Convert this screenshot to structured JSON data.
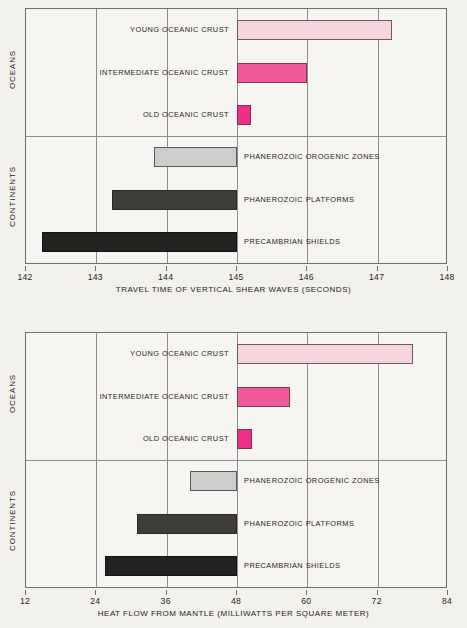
{
  "figure": {
    "title": "",
    "background": "#f3f1ec"
  },
  "colors": {
    "young_oceanic_crust": "#f6d3dd",
    "intermediate_oceanic_crust": "#f2599b",
    "old_oceanic_crust": "#ef2f86",
    "phanerozoic_orogenic_zones": "#cdcdcb",
    "phanerozoic_platforms": "#3e3d3a",
    "precambrian_shields": "#232220",
    "frame": "#6e6e6e",
    "grid": "#8d8d8d"
  },
  "groups": {
    "oceans": "OCEANS",
    "continents": "CONTINENTS"
  },
  "chart_data": [
    {
      "type": "bar",
      "orientation": "horizontal",
      "id": "travel-time",
      "title": "",
      "xlabel": "TRAVEL TIME OF VERTICAL SHEAR WAVES (SECONDS)",
      "ylabel": "",
      "xlim": [
        142,
        148
      ],
      "xticks": [
        142,
        143,
        144,
        145,
        146,
        147,
        148
      ],
      "xticklabels": [
        "142",
        "143",
        "144",
        "145",
        "146",
        "147",
        "148"
      ],
      "grid": true,
      "legend": "none",
      "group_divider_after": 3,
      "categories": [
        "YOUNG OCEANIC CRUST",
        "INTERMEDIATE OCEANIC CRUST",
        "OLD OCEANIC CRUST",
        "PHANEROZOIC OROGENIC ZONES",
        "PHANEROZOIC PLATFORMS",
        "PRECAMBRIAN SHIELDS"
      ],
      "bars": [
        {
          "label": "YOUNG OCEANIC CRUST",
          "start": 145.0,
          "end": 147.2,
          "style": "young",
          "group": "oceans",
          "label_side": "left"
        },
        {
          "label": "INTERMEDIATE OCEANIC CRUST",
          "start": 145.0,
          "end": 146.0,
          "style": "intermediate",
          "group": "oceans",
          "label_side": "left"
        },
        {
          "label": "OLD OCEANIC CRUST",
          "start": 145.0,
          "end": 145.2,
          "style": "old",
          "group": "oceans",
          "label_side": "left"
        },
        {
          "label": "PHANEROZOIC OROGENIC ZONES",
          "start": 143.82,
          "end": 145.0,
          "style": "orogenic",
          "group": "continents",
          "label_side": "right"
        },
        {
          "label": "PHANEROZOIC PLATFORMS",
          "start": 143.22,
          "end": 145.0,
          "style": "platforms",
          "group": "continents",
          "label_side": "right"
        },
        {
          "label": "PRECAMBRIAN SHIELDS",
          "start": 142.23,
          "end": 145.0,
          "style": "shields",
          "group": "continents",
          "label_side": "right"
        }
      ]
    },
    {
      "type": "bar",
      "orientation": "horizontal",
      "id": "heat-flow",
      "title": "",
      "xlabel": "HEAT FLOW FROM MANTLE (MILLIWATTS PER SQUARE METER)",
      "ylabel": "",
      "xlim": [
        12,
        84
      ],
      "xticks": [
        12,
        24,
        36,
        48,
        60,
        72,
        84
      ],
      "xticklabels": [
        "12",
        "24",
        "36",
        "48",
        "60",
        "72",
        "84"
      ],
      "grid": true,
      "legend": "none",
      "group_divider_after": 3,
      "categories": [
        "YOUNG OCEANIC CRUST",
        "INTERMEDIATE OCEANIC CRUST",
        "OLD OCEANIC CRUST",
        "PHANEROZOIC OROGENIC ZONES",
        "PHANEROZOIC PLATFORMS",
        "PRECAMBRIAN SHIELDS"
      ],
      "bars": [
        {
          "label": "YOUNG OCEANIC CRUST",
          "start": 48.0,
          "end": 78.0,
          "style": "young",
          "group": "oceans",
          "label_side": "left"
        },
        {
          "label": "INTERMEDIATE OCEANIC CRUST",
          "start": 48.0,
          "end": 57.0,
          "style": "intermediate",
          "group": "oceans",
          "label_side": "left"
        },
        {
          "label": "OLD OCEANIC CRUST",
          "start": 48.0,
          "end": 50.5,
          "style": "old",
          "group": "oceans",
          "label_side": "left"
        },
        {
          "label": "PHANEROZOIC OROGENIC ZONES",
          "start": 40.0,
          "end": 48.0,
          "style": "orogenic",
          "group": "continents",
          "label_side": "right"
        },
        {
          "label": "PHANEROZOIC PLATFORMS",
          "start": 31.0,
          "end": 48.0,
          "style": "platforms",
          "group": "continents",
          "label_side": "right"
        },
        {
          "label": "PRECAMBRIAN SHIELDS",
          "start": 25.5,
          "end": 48.0,
          "style": "shields",
          "group": "continents",
          "label_side": "right"
        }
      ]
    }
  ]
}
